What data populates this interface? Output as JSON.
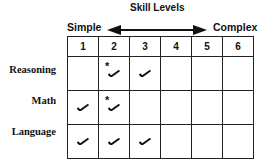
{
  "header": {
    "title": "Skill Levels",
    "left_label": "Simple",
    "right_label": "Complex"
  },
  "columns": [
    "1",
    "2",
    "3",
    "4",
    "5",
    "6"
  ],
  "rows": [
    {
      "label": "Reasoning",
      "cells": [
        "",
        "star-check",
        "check",
        "",
        "",
        ""
      ]
    },
    {
      "label": "Math",
      "cells": [
        "check",
        "star-check",
        "",
        "",
        "",
        ""
      ]
    },
    {
      "label": "Language",
      "cells": [
        "check",
        "check",
        "check",
        "",
        "",
        ""
      ]
    }
  ],
  "marks": {
    "check": "✓",
    "star": "*"
  }
}
